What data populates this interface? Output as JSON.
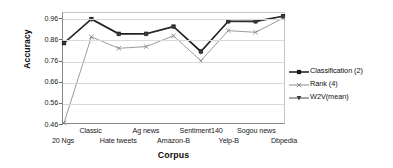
{
  "chart_data": {
    "type": "line",
    "title": "",
    "xlabel": "Corpus",
    "ylabel": "Accuracy",
    "categories": [
      "20 Ngs",
      "Classic",
      "Hate tweets",
      "Ag news",
      "Amazon-B",
      "Sentiment140",
      "Yelp-B",
      "Sogou news",
      "Dbpedia"
    ],
    "series": [
      {
        "name": "Classification (2)",
        "marker": "square",
        "color": "#1a1a1a",
        "values": [
          0.845,
          0.961,
          0.89,
          0.89,
          0.925,
          0.805,
          0.95,
          0.95,
          0.975
        ]
      },
      {
        "name": "Rank (4)",
        "marker": "x",
        "color": "#808080",
        "values": [
          0.46,
          0.875,
          0.82,
          0.828,
          0.88,
          0.76,
          0.905,
          0.897,
          0.965
        ]
      },
      {
        "name": "W2V(mean)",
        "marker": "triangle-down",
        "color": "#3a3a3a",
        "values": [
          0.843,
          0.958,
          0.887,
          0.888,
          0.922,
          0.8,
          0.948,
          0.947,
          0.973
        ]
      }
    ],
    "ylim": [
      0.46,
      0.99
    ],
    "yticks": [
      0.46,
      0.56,
      0.66,
      0.76,
      0.86,
      0.96
    ],
    "ytick_labels": [
      "0.46",
      "0.56",
      "0.66",
      "0.76",
      "0.86",
      "0.96"
    ],
    "grid": true,
    "legend_position": "right"
  },
  "axes": {
    "y_title": "Accuracy",
    "x_title": "Corpus",
    "y_tick_labels": [
      "0.96",
      "0.86",
      "0.76",
      "0.66",
      "0.56",
      "0.46"
    ],
    "x_tick_labels": [
      "20 Ngs",
      "Classic",
      "Hate tweets",
      "Ag news",
      "Amazon-B",
      "Sentiment140",
      "Yelp-B",
      "Sogou news",
      "Dbpedia"
    ]
  },
  "legend": {
    "entries": [
      {
        "label": "Classification (2)",
        "icon": "square-marker-icon"
      },
      {
        "label": "Rank (4)",
        "icon": "x-marker-icon"
      },
      {
        "label": "W2V(mean)",
        "icon": "triangle-down-marker-icon"
      }
    ]
  }
}
